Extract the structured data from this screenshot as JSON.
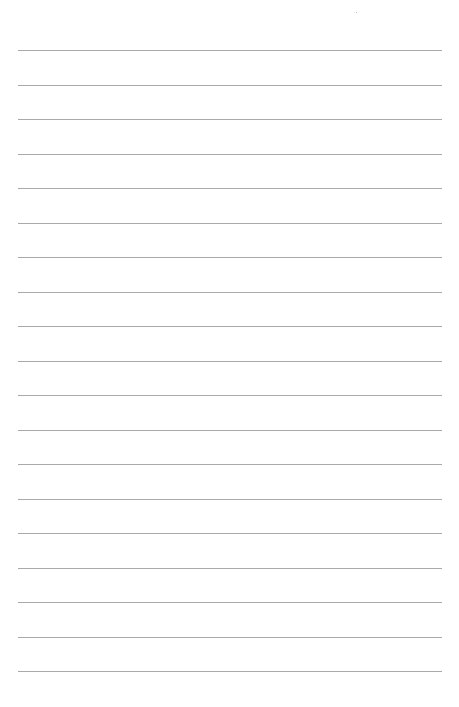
{
  "page": {
    "type": "blank lined notebook page",
    "line_count": 19,
    "first_line_y": 50,
    "line_spacing": 34.5,
    "line_left": 18,
    "line_right": 442,
    "line_color": "#9a9a9a",
    "background_color": "#ffffff"
  }
}
